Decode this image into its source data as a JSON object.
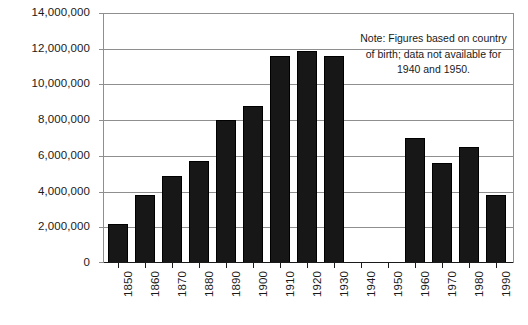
{
  "chart_data": {
    "type": "bar",
    "title": "",
    "subtitle": "",
    "xlabel": "",
    "ylabel": "",
    "categories": [
      "1850",
      "1860",
      "1870",
      "1880",
      "1890",
      "1900",
      "1910",
      "1920",
      "1930",
      "1940",
      "1950",
      "1960",
      "1970",
      "1980",
      "1990"
    ],
    "values": [
      2200000,
      3800000,
      4900000,
      5700000,
      8000000,
      8800000,
      11600000,
      11900000,
      11600000,
      null,
      null,
      7000000,
      5600000,
      6500000,
      3800000
    ],
    "ylim": [
      0,
      14000000
    ],
    "ytick_values": [
      0,
      2000000,
      4000000,
      6000000,
      8000000,
      10000000,
      12000000,
      14000000
    ],
    "ytick_labels": [
      "0",
      "2,000,000",
      "4,000,000",
      "6,000,000",
      "8,000,000",
      "10,000,000",
      "12,000,000",
      "14,000,000"
    ],
    "grid": true,
    "legend": false,
    "legend_position": "none",
    "bar_color": "#171717",
    "grid_color": "#8f8f8f",
    "axis_color": "#1a1a1a",
    "missing_categories": [
      "1940",
      "1950"
    ],
    "annotations": [
      {
        "name": "note",
        "text": "Note: Figures based on country of birth; data not available for 1940 and 1950."
      }
    ]
  }
}
